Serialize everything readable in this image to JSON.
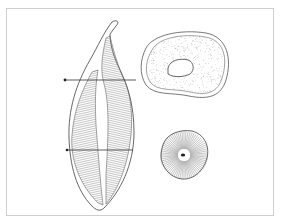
{
  "figure": {
    "title": "",
    "colors": {
      "outline": "#555555",
      "hatch": "#8a8a8a",
      "frame": "#cfcfcf",
      "background": "#ffffff"
    },
    "elements": {
      "longitudinal_section": "tooth-longitudinal-section",
      "upper_section_line": "section-line-upper",
      "lower_section_line": "section-line-lower",
      "upper_cross_section": "cross-section-upper",
      "lower_cross_section": "cross-section-lower"
    }
  }
}
